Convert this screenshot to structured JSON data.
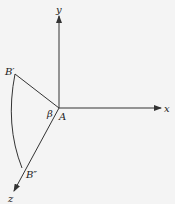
{
  "diagram": {
    "type": "3d-axes-rotation",
    "labels": {
      "x_axis": "x",
      "y_axis": "y",
      "z_axis": "z",
      "origin": "A",
      "angle": "β",
      "point_b_prime": "B′",
      "point_b_double_prime": "B″"
    },
    "colors": {
      "background": "#f4f4f4",
      "stroke": "#333333",
      "text": "#222222"
    }
  }
}
